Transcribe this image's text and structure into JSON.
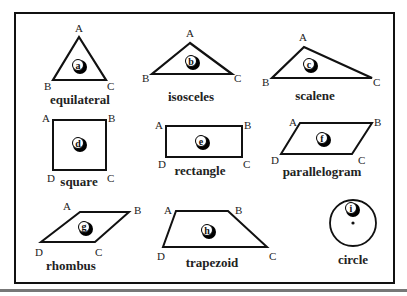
{
  "shapes": [
    {
      "id": "a",
      "name": "equilateral",
      "vertices": [
        "A",
        "B",
        "C"
      ]
    },
    {
      "id": "b",
      "name": "isosceles",
      "vertices": [
        "A",
        "B",
        "C"
      ]
    },
    {
      "id": "c",
      "name": "scalene",
      "vertices": [
        "A",
        "B",
        "C"
      ]
    },
    {
      "id": "d",
      "name": "square",
      "vertices": [
        "A",
        "B",
        "C",
        "D"
      ]
    },
    {
      "id": "e",
      "name": "rectangle",
      "vertices": [
        "A",
        "B",
        "C",
        "D"
      ]
    },
    {
      "id": "f",
      "name": "parallelogram",
      "vertices": [
        "A",
        "B",
        "C",
        "D"
      ]
    },
    {
      "id": "g",
      "name": "rhombus",
      "vertices": [
        "A",
        "B",
        "C",
        "D"
      ]
    },
    {
      "id": "h",
      "name": "trapezoid",
      "vertices": [
        "A",
        "B",
        "C",
        "D"
      ]
    },
    {
      "id": "i",
      "name": "circle",
      "vertices": []
    }
  ],
  "colors": {
    "stroke": "#111111",
    "text": "#222222",
    "background": "#ffffff"
  }
}
